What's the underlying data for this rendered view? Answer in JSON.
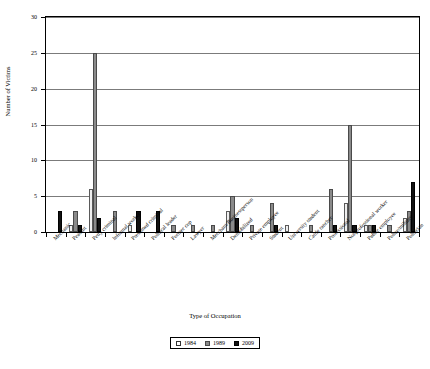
{
  "chart_data": {
    "type": "bar",
    "title": "",
    "xlabel": "Type of Occupation",
    "ylabel": "Number of Victims",
    "ylim": [
      0,
      30
    ],
    "yticks": [
      0,
      5,
      10,
      15,
      20,
      25,
      30
    ],
    "grid": true,
    "legend_position": "bottom-center",
    "categories": [
      "Mechanic",
      "Peasant",
      "Petty criminal",
      "Informal worker",
      "Presumed criminal",
      "Political leader",
      "Former cop",
      "Lawyer",
      "Merchant/Businessperson",
      "Demobilized",
      "Private employee",
      "Student",
      "University student",
      "Cattle rancher",
      "Professional",
      "Nonprofessional worker",
      "Public employee",
      "Police/military",
      "Politician"
    ],
    "series": [
      {
        "name": "1984",
        "color": "#efefef",
        "values": [
          0,
          1,
          6,
          0,
          1,
          0,
          0,
          0,
          0,
          3,
          0,
          0,
          1,
          0,
          0,
          4,
          1,
          0,
          2
        ]
      },
      {
        "name": "1989",
        "color": "#8a8a8a",
        "values": [
          0,
          3,
          25,
          3,
          0,
          0,
          1,
          1,
          1,
          5,
          1,
          4,
          0,
          1,
          6,
          15,
          1,
          1,
          3
        ]
      },
      {
        "name": "2009",
        "color": "#111111",
        "values": [
          3,
          1,
          2,
          0,
          3,
          3,
          0,
          0,
          0,
          2,
          0,
          1,
          0,
          0,
          1,
          1,
          1,
          0,
          7
        ]
      }
    ]
  },
  "legend": {
    "entries": [
      {
        "label": "1984"
      },
      {
        "label": "1989"
      },
      {
        "label": "2009"
      }
    ]
  },
  "axes": {
    "y_title": "Number of Victims",
    "x_title": "Type of Occupation",
    "y_tick_labels": [
      "0",
      "5",
      "10",
      "15",
      "20",
      "25",
      "30"
    ]
  }
}
